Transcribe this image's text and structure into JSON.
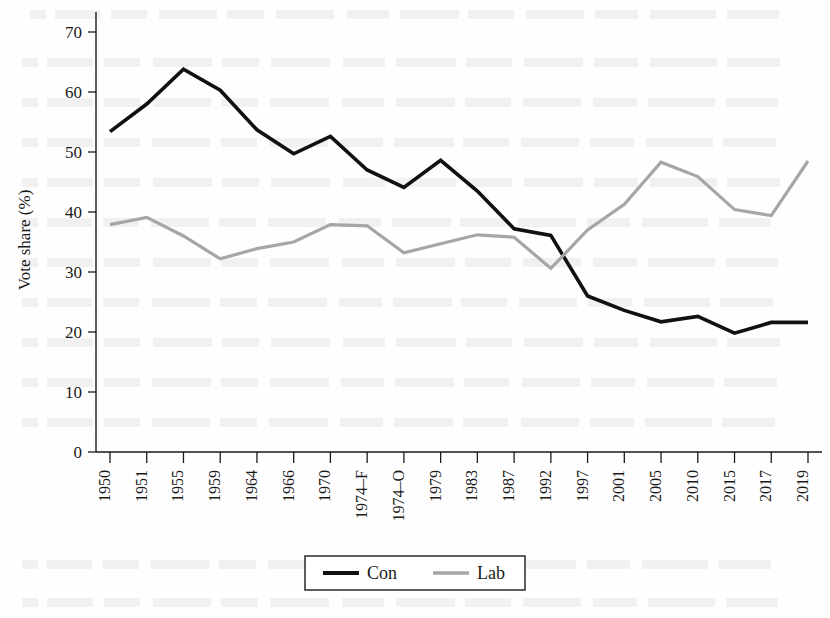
{
  "chart_data": {
    "type": "line",
    "title": "",
    "xlabel": "",
    "ylabel": "Vote share (%)",
    "ylim": [
      0,
      70
    ],
    "yticks": [
      0,
      10,
      20,
      30,
      40,
      50,
      60,
      70
    ],
    "grid": false,
    "legend_position": "bottom-center",
    "categories": [
      "1950",
      "1951",
      "1955",
      "1959",
      "1964",
      "1966",
      "1970",
      "1974–F",
      "1974–O",
      "1979",
      "1983",
      "1987",
      "1992",
      "1997",
      "2001",
      "2005",
      "2010",
      "2015",
      "2017",
      "2019"
    ],
    "series": [
      {
        "name": "Con",
        "color": "#111111",
        "width": 3.6,
        "values": [
          53.4,
          58.0,
          63.8,
          60.3,
          53.7,
          49.7,
          52.6,
          47.0,
          44.1,
          48.6,
          43.5,
          37.2,
          36.1,
          26.0,
          23.6,
          21.7,
          22.6,
          19.8,
          21.6,
          21.6
        ]
      },
      {
        "name": "Lab",
        "color": "#a6a6a6",
        "width": 3.2,
        "values": [
          37.9,
          39.1,
          36.0,
          32.2,
          33.9,
          35.0,
          37.9,
          37.7,
          33.2,
          34.7,
          36.2,
          35.8,
          30.6,
          37.0,
          41.3,
          48.3,
          45.9,
          40.4,
          39.4,
          48.5
        ]
      }
    ]
  },
  "axis": {
    "y_label": "Vote share (%)"
  },
  "legend": {
    "entries": [
      {
        "label": "Con",
        "color": "#111111",
        "width": 4.0
      },
      {
        "label": "Lab",
        "color": "#a6a6a6",
        "width": 3.4
      }
    ]
  }
}
